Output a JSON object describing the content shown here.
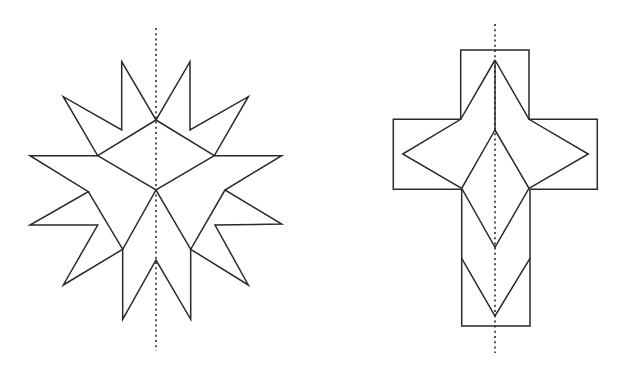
{
  "figures": [
    {
      "name": "star-figure",
      "description": "Twelve-point star composed of rhombus pieces with a vertical line of symmetry",
      "axis_of_symmetry": {
        "x1": 156,
        "y1": 28,
        "x2": 156,
        "y2": 351
      },
      "outline": "121.7,61.7 156,120 190,61.7 190,130 248.3,96.7 214.3,155.7 281.7,155.7 225,190 281.7,224 215,225 248.3,285 190.7,249.3 190.7,319.3 156,260 122.7,319.3 122.7,249.3 63.3,285 97.7,225 30,225 88.3,191.7 30,155.7 97.7,155.7 63.3,96.7 121.7,130",
      "inner_lines": [
        "97.7,155.7 156,120 214.3,155.7",
        "97.7,155.7 156,190 214.3,155.7",
        "88.3,191.7 122.7,249.3 156,190 190.7,249.3 225,190"
      ]
    },
    {
      "name": "cross-figure",
      "description": "Cross shape with an inscribed four-point star, inner rhombus and chevron, with a vertical line of symmetry",
      "axis_of_symmetry": {
        "x1": 495,
        "y1": 24,
        "x2": 495,
        "y2": 353
      },
      "outline": "460.7,50 529,50 529,119.3 597.3,119.3 597.3,189.3 530,189.3 530,326 461.7,326 461.7,189.3 393.3,189.3 393.3,119.3 460.7,119.3",
      "inner_lines": [
        "495,60 460.7,119.3 402.7,154 461.7,188.3",
        "495,60 529,119.3 588.3,154 529,188.3",
        "495,60 495,130",
        "495,130 461.7,188.3 495,247.3 529,188.3 495,130",
        "461.7,258.3 495,316 530,258.3"
      ]
    }
  ],
  "colors": {
    "stroke": "#2a2a2a",
    "background": "#ffffff"
  }
}
